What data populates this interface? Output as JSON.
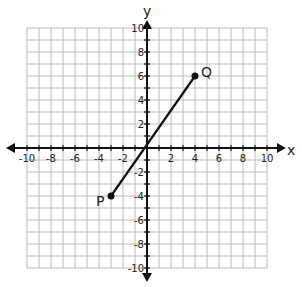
{
  "chart_data": {
    "type": "scatter",
    "title": "",
    "xlabel": "x",
    "ylabel": "y",
    "xlim": [
      -10,
      10
    ],
    "ylim": [
      -10,
      10
    ],
    "grid": true,
    "x_ticks": [
      "-10",
      "-8",
      "-6",
      "-4",
      "-2",
      "2",
      "4",
      "6",
      "8",
      "10"
    ],
    "y_ticks": [
      "10",
      "8",
      "6",
      "4",
      "2",
      "-2",
      "-4",
      "-6",
      "-8",
      "-10"
    ],
    "points": [
      {
        "label": "P",
        "x": -3,
        "y": -4
      },
      {
        "label": "Q",
        "x": 4,
        "y": 6
      }
    ],
    "segments": [
      {
        "from": "P",
        "to": "Q"
      }
    ]
  },
  "axes": {
    "x_label": "x",
    "y_label": "y"
  },
  "points": {
    "p_label": "P",
    "q_label": "Q"
  }
}
